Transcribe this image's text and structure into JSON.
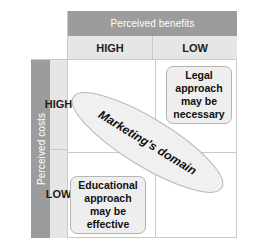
{
  "diagram": {
    "column_axis": {
      "label": "Perceived benefits",
      "levels": [
        "HIGH",
        "LOW"
      ]
    },
    "row_axis": {
      "label": "Perceived costs",
      "levels": [
        "HIGH",
        "LOW"
      ]
    },
    "callouts": {
      "top_right": "Legal approach may be necessary",
      "bottom_left": "Educational approach may be effective"
    },
    "overlay": {
      "label": "Marketing's domain",
      "shape": "ellipse"
    },
    "colors": {
      "header_band": "#9c9c9c",
      "subheader_band": "#e6e6e6",
      "grid_line": "#c9c9c9",
      "callout_fill": "#eeeeee",
      "callout_border": "#b5b5b5",
      "ellipse_fill": "#f0f0f0",
      "ellipse_border": "#b9b9b9",
      "header_text": "#ffffff",
      "body_text": "#111111"
    }
  }
}
